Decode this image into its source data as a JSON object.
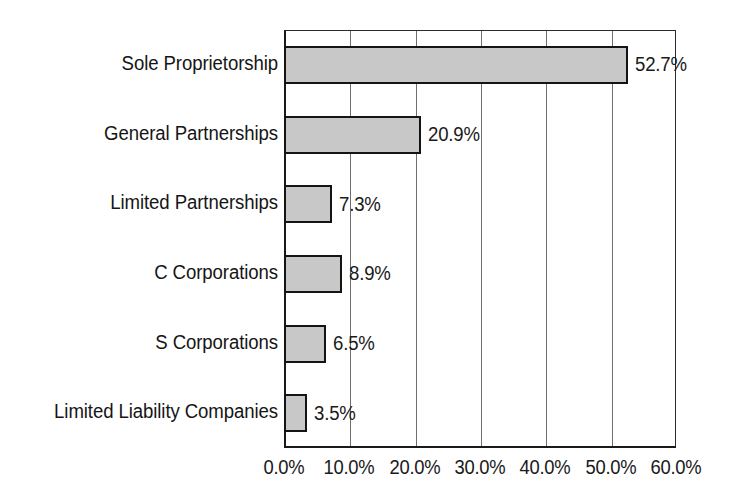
{
  "chart_data": {
    "type": "bar",
    "orientation": "horizontal",
    "title": "",
    "subtitle": "",
    "xlabel": "",
    "ylabel": "",
    "categories": [
      "Sole Proprietorship",
      "General Partnerships",
      "Limited Partnerships",
      "C Corporations",
      "S Corporations",
      "Limited Liability Companies"
    ],
    "values": [
      52.7,
      20.9,
      7.3,
      8.9,
      6.5,
      3.5
    ],
    "data_labels": [
      "52.7%",
      "20.9%",
      "7.3%",
      "8.9%",
      "6.5%",
      "3.5%"
    ],
    "xlim": [
      0,
      60
    ],
    "x_ticks": [
      0,
      10,
      20,
      30,
      40,
      50,
      60
    ],
    "x_tick_labels": [
      "0.0%",
      "10.0%",
      "20.0%",
      "30.0%",
      "40.0%",
      "50.0%",
      "60.0%"
    ],
    "grid": true,
    "grid_axis": "x",
    "legend": false,
    "legend_position": "none",
    "bar_fill_color": "#c8c8c8",
    "bar_border_color": "#141414",
    "axis_color": "#1a1a1a",
    "gridline_color": "#6e6e6e",
    "background_color": "#ffffff",
    "text_color": "#151515"
  }
}
